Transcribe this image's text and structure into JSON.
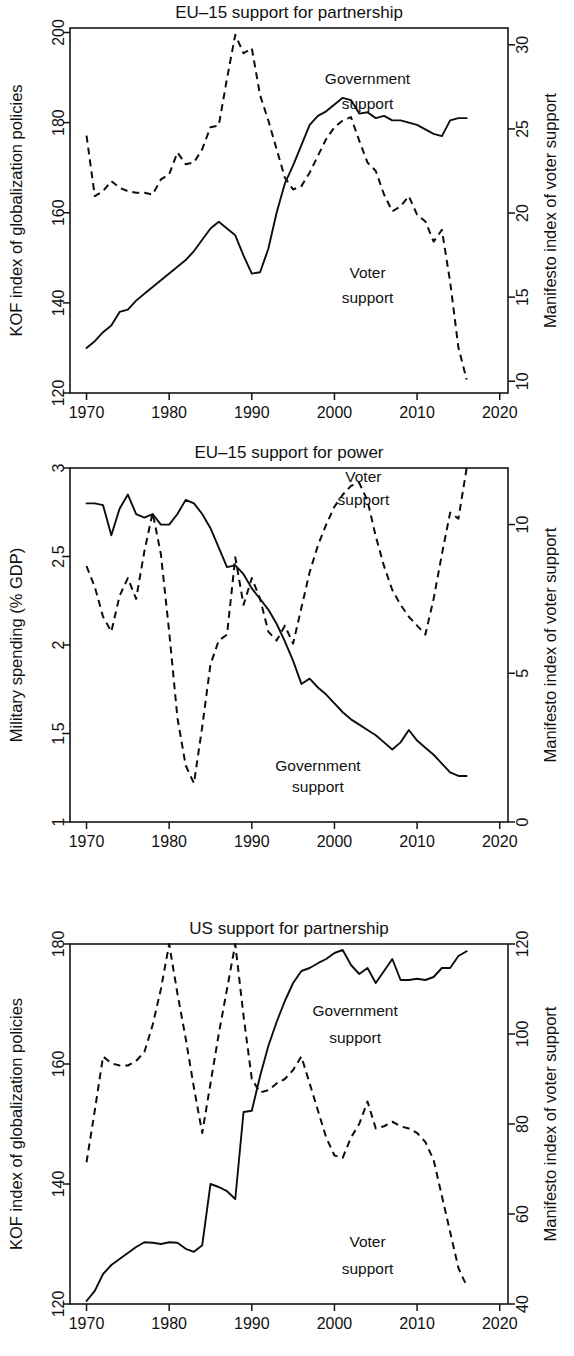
{
  "figure": {
    "width": 574,
    "height": 1356,
    "background": "#ffffff",
    "line_color": "#0d0d0d"
  },
  "chart_data": [
    {
      "type": "line",
      "title": "EU–15 support for partnership",
      "xlabel": "",
      "ylabel": "KOF index of globalization policies",
      "y2label": "Manifesto index of voter support",
      "xlim": [
        1968,
        2021
      ],
      "xticks": [
        1970,
        1980,
        1990,
        2000,
        2010,
        2020
      ],
      "xticklabels": [
        "1970",
        "1980",
        "1990",
        "2000",
        "2010",
        "2020"
      ],
      "ylim": [
        120,
        201
      ],
      "yticks": [
        120,
        140,
        160,
        180,
        200
      ],
      "yticklabels": [
        "120",
        "140",
        "160",
        "180",
        "200"
      ],
      "y2lim": [
        9.3,
        31.0
      ],
      "y2ticks": [
        10,
        15,
        20,
        25,
        30
      ],
      "y2ticklabels": [
        "10",
        "15",
        "20",
        "25",
        "30"
      ],
      "grid": false,
      "legend": "inline-annotations",
      "annotations": [
        {
          "text": "Government",
          "x": 2004.0,
          "y_axis": "left",
          "y": 188.5
        },
        {
          "text": "support",
          "x": 2004.0,
          "y_axis": "left",
          "y": 183.0
        },
        {
          "text": "Voter",
          "x": 2004.0,
          "y_axis": "left",
          "y": 145.5
        },
        {
          "text": "support",
          "x": 2004.0,
          "y_axis": "left",
          "y": 140.0
        }
      ],
      "series": [
        {
          "name": "Government support",
          "style": "solid",
          "axis": "left",
          "x": [
            1970,
            1971,
            1972,
            1973,
            1974,
            1975,
            1976,
            1977,
            1978,
            1979,
            1980,
            1981,
            1982,
            1983,
            1984,
            1985,
            1986,
            1987,
            1988,
            1989,
            1990,
            1991,
            1992,
            1993,
            1994,
            1995,
            1996,
            1997,
            1998,
            1999,
            2000,
            2001,
            2002,
            2003,
            2004,
            2005,
            2006,
            2007,
            2008,
            2009,
            2010,
            2011,
            2012,
            2013,
            2014,
            2015,
            2016
          ],
          "values": [
            130.0,
            131.5,
            133.5,
            135.0,
            138.0,
            138.5,
            140.5,
            142.0,
            143.5,
            145.0,
            146.5,
            148.0,
            149.5,
            151.5,
            154.0,
            156.5,
            158.0,
            156.5,
            155.0,
            150.5,
            146.5,
            146.8,
            152.0,
            160.0,
            166.5,
            170.5,
            175.0,
            179.5,
            181.5,
            182.5,
            184.0,
            185.5,
            185.0,
            182.0,
            182.3,
            181.0,
            181.5,
            180.5,
            180.5,
            180.0,
            179.5,
            178.5,
            177.5,
            177.0,
            180.5,
            181.0,
            181.0
          ]
        },
        {
          "name": "Voter support",
          "style": "dashed",
          "axis": "right",
          "x": [
            1970,
            1971,
            1972,
            1973,
            1974,
            1975,
            1976,
            1977,
            1978,
            1979,
            1980,
            1981,
            1982,
            1983,
            1984,
            1985,
            1986,
            1987,
            1988,
            1989,
            1990,
            1991,
            1992,
            1993,
            1994,
            1995,
            1996,
            1997,
            1998,
            1999,
            2000,
            2001,
            2002,
            2003,
            2004,
            2005,
            2006,
            2007,
            2008,
            2009,
            2010,
            2011,
            2012,
            2013,
            2014,
            2015,
            2016
          ],
          "values": [
            24.6,
            21.0,
            21.3,
            21.9,
            21.5,
            21.3,
            21.2,
            21.2,
            21.1,
            22.0,
            22.3,
            23.6,
            22.9,
            23.0,
            23.8,
            25.1,
            25.2,
            28.0,
            30.6,
            29.5,
            29.8,
            27.0,
            25.5,
            23.8,
            22.1,
            21.4,
            21.6,
            22.4,
            23.4,
            24.4,
            25.1,
            25.5,
            25.7,
            24.3,
            23.0,
            22.5,
            21.1,
            20.1,
            20.4,
            21.0,
            19.9,
            19.5,
            18.3,
            19.0,
            15.9,
            12.0,
            10.1
          ]
        }
      ]
    },
    {
      "type": "line",
      "title": "EU–15 support for power",
      "xlabel": "",
      "ylabel": "Military spending (% GDP)",
      "y2label": "Manifesto index of voter support",
      "xlim": [
        1968,
        2021
      ],
      "xticks": [
        1970,
        1980,
        1990,
        2000,
        2010,
        2020
      ],
      "xticklabels": [
        "1970",
        "1980",
        "1990",
        "2000",
        "2010",
        "2020"
      ],
      "ylim": [
        1.0,
        3.0
      ],
      "yticks": [
        1,
        1.5,
        2,
        2.5,
        3
      ],
      "yticklabels": [
        "1",
        "1.5",
        "2",
        "2.5",
        "3"
      ],
      "y2lim": [
        0,
        11.9
      ],
      "y2ticks": [
        0,
        5,
        10
      ],
      "y2ticklabels": [
        "0",
        "5",
        "10"
      ],
      "grid": false,
      "legend": "inline-annotations",
      "annotations": [
        {
          "text": "Voter",
          "x": 2003.5,
          "y_axis": "left",
          "y": 2.92
        },
        {
          "text": "support",
          "x": 2003.5,
          "y_axis": "left",
          "y": 2.79
        },
        {
          "text": "Government",
          "x": 1998.0,
          "y_axis": "left",
          "y": 1.29
        },
        {
          "text": "support",
          "x": 1998.0,
          "y_axis": "left",
          "y": 1.17
        }
      ],
      "series": [
        {
          "name": "Government support",
          "style": "solid",
          "axis": "left",
          "x": [
            1970,
            1971,
            1972,
            1973,
            1974,
            1975,
            1976,
            1977,
            1978,
            1979,
            1980,
            1981,
            1982,
            1983,
            1984,
            1985,
            1986,
            1987,
            1988,
            1989,
            1990,
            1991,
            1992,
            1993,
            1994,
            1995,
            1996,
            1997,
            1998,
            1999,
            2000,
            2001,
            2002,
            2003,
            2004,
            2005,
            2006,
            2007,
            2008,
            2009,
            2010,
            2011,
            2012,
            2013,
            2014,
            2015,
            2016
          ],
          "values": [
            2.8,
            2.8,
            2.79,
            2.62,
            2.77,
            2.85,
            2.74,
            2.72,
            2.74,
            2.68,
            2.68,
            2.74,
            2.82,
            2.8,
            2.74,
            2.66,
            2.55,
            2.44,
            2.45,
            2.4,
            2.32,
            2.26,
            2.2,
            2.12,
            2.02,
            1.91,
            1.78,
            1.81,
            1.76,
            1.72,
            1.67,
            1.62,
            1.58,
            1.55,
            1.52,
            1.49,
            1.45,
            1.41,
            1.45,
            1.52,
            1.46,
            1.42,
            1.38,
            1.33,
            1.28,
            1.26,
            1.26
          ]
        },
        {
          "name": "Voter support",
          "style": "dashed",
          "axis": "right",
          "x": [
            1970,
            1971,
            1972,
            1973,
            1974,
            1975,
            1976,
            1977,
            1978,
            1979,
            1980,
            1981,
            1982,
            1983,
            1984,
            1985,
            1986,
            1987,
            1988,
            1989,
            1990,
            1991,
            1992,
            1993,
            1994,
            1995,
            1996,
            1997,
            1998,
            1999,
            2000,
            2001,
            2002,
            2003,
            2004,
            2005,
            2006,
            2007,
            2008,
            2009,
            2010,
            2011,
            2012,
            2013,
            2014,
            2015,
            2016
          ],
          "values": [
            8.6,
            7.9,
            6.9,
            6.4,
            7.6,
            8.2,
            7.5,
            9.1,
            10.4,
            9.0,
            6.4,
            3.5,
            1.9,
            1.3,
            3.2,
            5.3,
            6.1,
            6.3,
            8.9,
            7.3,
            8.2,
            7.5,
            6.4,
            6.1,
            6.6,
            6.0,
            7.2,
            8.4,
            9.3,
            10.0,
            10.6,
            11.0,
            11.3,
            11.4,
            10.8,
            9.6,
            8.6,
            7.8,
            7.3,
            6.9,
            6.6,
            6.3,
            7.5,
            9.0,
            10.4,
            10.2,
            11.9
          ]
        }
      ]
    },
    {
      "type": "line",
      "title": "US support for partnership",
      "xlabel": "",
      "ylabel": "KOF index of globalization policies",
      "y2label": "Manifesto index of voter support",
      "xlim": [
        1968,
        2021
      ],
      "xticks": [
        1970,
        1980,
        1990,
        2000,
        2010,
        2020
      ],
      "xticklabels": [
        "1970",
        "1980",
        "1990",
        "2000",
        "2010",
        "2020"
      ],
      "ylim": [
        120,
        180
      ],
      "yticks": [
        120,
        140,
        160,
        180
      ],
      "yticklabels": [
        "120",
        "140",
        "160",
        "180"
      ],
      "y2lim": [
        40,
        120
      ],
      "y2ticks": [
        40,
        60,
        80,
        100,
        120
      ],
      "y2ticklabels": [
        "40",
        "60",
        "80",
        "100",
        "120"
      ],
      "grid": false,
      "legend": "inline-annotations",
      "annotations": [
        {
          "text": "Government",
          "x": 2002.5,
          "y_axis": "left",
          "y": 168.0
        },
        {
          "text": "support",
          "x": 2002.5,
          "y_axis": "left",
          "y": 163.5
        },
        {
          "text": "Voter",
          "x": 2004.0,
          "y_axis": "left",
          "y": 129.5
        },
        {
          "text": "support",
          "x": 2004.0,
          "y_axis": "left",
          "y": 125.0
        }
      ],
      "series": [
        {
          "name": "Government support",
          "style": "solid",
          "axis": "left",
          "x": [
            1970,
            1971,
            1972,
            1973,
            1974,
            1975,
            1976,
            1977,
            1978,
            1979,
            1980,
            1981,
            1982,
            1983,
            1984,
            1985,
            1986,
            1987,
            1988,
            1989,
            1990,
            1991,
            1992,
            1993,
            1994,
            1995,
            1996,
            1997,
            1998,
            1999,
            2000,
            2001,
            2002,
            2003,
            2004,
            2005,
            2006,
            2007,
            2008,
            2009,
            2010,
            2011,
            2012,
            2013,
            2014,
            2015,
            2016
          ],
          "values": [
            120.5,
            122.2,
            125.0,
            126.5,
            127.5,
            128.5,
            129.5,
            130.3,
            130.2,
            130.0,
            130.3,
            130.2,
            129.2,
            128.7,
            129.8,
            140.0,
            139.5,
            138.8,
            137.5,
            152.0,
            152.2,
            158.0,
            163.0,
            167.0,
            170.5,
            173.5,
            175.5,
            176.0,
            176.8,
            177.5,
            178.5,
            179.0,
            176.5,
            175.0,
            176.0,
            173.5,
            175.5,
            177.5,
            174.0,
            174.0,
            174.2,
            174.0,
            174.5,
            176.0,
            176.0,
            178.0,
            178.8
          ]
        },
        {
          "name": "Voter support",
          "style": "dashed",
          "axis": "right",
          "x": [
            1970,
            1971,
            1972,
            1973,
            1974,
            1975,
            1976,
            1977,
            1978,
            1979,
            1980,
            1981,
            1982,
            1983,
            1984,
            1985,
            1986,
            1987,
            1988,
            1989,
            1990,
            1991,
            1992,
            1993,
            1994,
            1995,
            1996,
            1997,
            1998,
            1999,
            2000,
            2001,
            2002,
            2003,
            2004,
            2005,
            2006,
            2007,
            2008,
            2009,
            2010,
            2011,
            2012,
            2013,
            2014,
            2015,
            2016
          ],
          "values": [
            71.5,
            83.0,
            95.0,
            93.5,
            93.0,
            93.0,
            94.0,
            96.0,
            102.0,
            110.0,
            120.0,
            109.0,
            99.0,
            88.0,
            78.0,
            89.0,
            100.0,
            110.0,
            120.0,
            104.0,
            90.0,
            87.0,
            87.5,
            89.0,
            90.0,
            92.0,
            95.0,
            89.0,
            83.0,
            77.0,
            73.0,
            72.5,
            77.0,
            80.0,
            85.0,
            79.0,
            79.5,
            80.5,
            79.5,
            79.0,
            78.0,
            76.0,
            72.0,
            64.0,
            56.0,
            48.0,
            44.0
          ]
        }
      ]
    }
  ]
}
